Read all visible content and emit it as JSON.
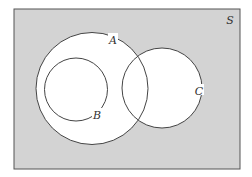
{
  "diagram": {
    "type": "venn",
    "colors": {
      "page": "#ffffff",
      "universe_fill": "#d3d3d3",
      "universe_stroke": "#555555",
      "set_fill": "#ffffff",
      "set_stroke": "#444444"
    },
    "universe": {
      "label": "S"
    },
    "sets": [
      {
        "id": "A",
        "label": "A"
      },
      {
        "id": "B",
        "label": "B",
        "subset_of": "A"
      },
      {
        "id": "C",
        "label": "C",
        "overlaps": "A"
      }
    ]
  }
}
